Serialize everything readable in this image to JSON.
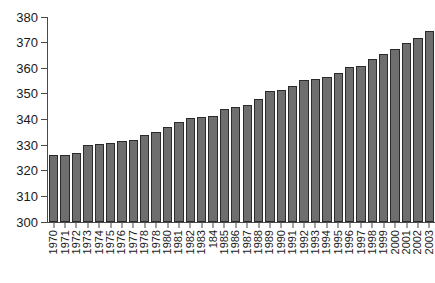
{
  "chart_data": {
    "type": "bar",
    "title": "",
    "subtitle": "",
    "xlabel": "",
    "ylabel": "",
    "ylim": [
      300,
      380
    ],
    "ytick_step": 10,
    "yticks": [
      380,
      370,
      360,
      350,
      340,
      330,
      320,
      310,
      300
    ],
    "grid": false,
    "legend": false,
    "legend_position": "none",
    "bar_color": "#6e6e6e",
    "bar_edge_color": "#2b2b2b",
    "axis_color": "#4a4a4a",
    "categories": [
      "1970",
      "1971",
      "1972",
      "1973",
      "1974",
      "1975",
      "1976",
      "1977",
      "1978",
      "1978",
      "1980",
      "1981",
      "1982",
      "1983",
      "184",
      "1985",
      "1986",
      "1987",
      "1988",
      "1989",
      "1990",
      "1991",
      "1992",
      "1993",
      "1994",
      "1995",
      "1996",
      "1997",
      "1998",
      "1999",
      "2000",
      "2001",
      "2002",
      "2003"
    ],
    "values": [
      326,
      326,
      327,
      330,
      330.5,
      331,
      331.5,
      332,
      334,
      335,
      337,
      339,
      340.5,
      341,
      341.5,
      344,
      345,
      345.5,
      348,
      351,
      351.5,
      353,
      355.5,
      356,
      356.5,
      358,
      360.5,
      361,
      363.5,
      365.5,
      367.5,
      370,
      372,
      374.5
    ]
  }
}
